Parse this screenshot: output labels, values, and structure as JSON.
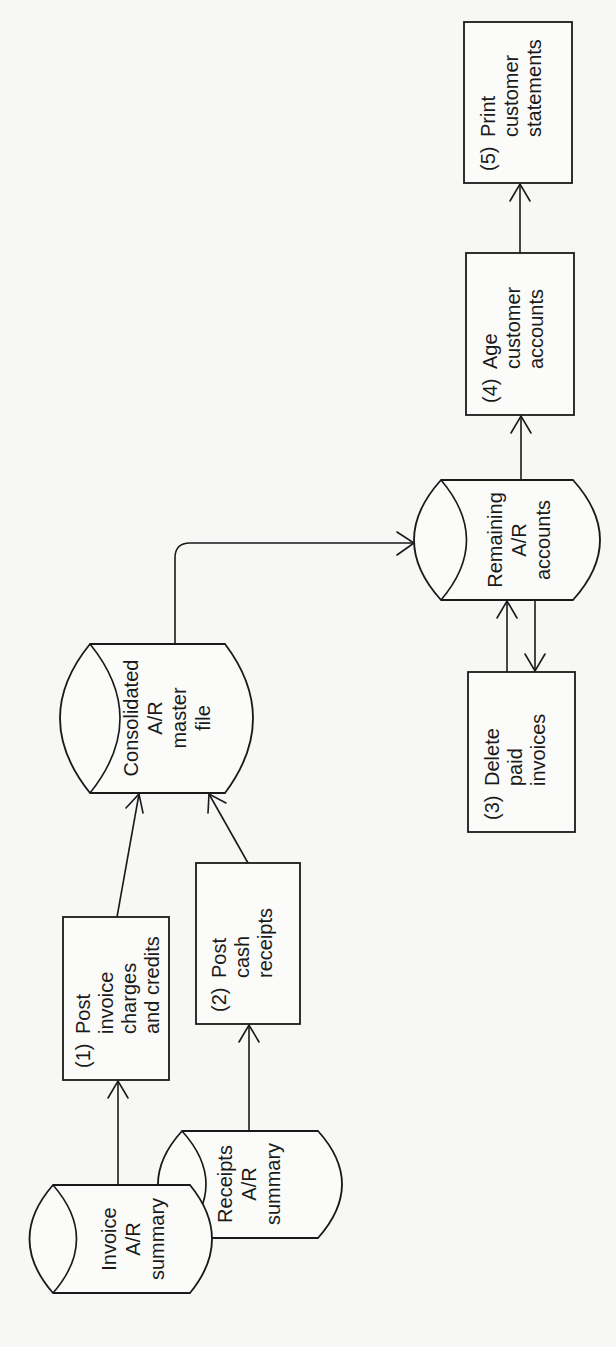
{
  "diagram": {
    "orientation": "rotated-90-ccw",
    "colors": {
      "ink": "#1a1a1a",
      "paper": "#f7f7f5"
    },
    "storage": {
      "invoice_summary": {
        "lines": [
          "Invoice",
          "A/R",
          "summary"
        ]
      },
      "receipts_summary": {
        "lines": [
          "Receipts",
          "A/R",
          "summary"
        ]
      },
      "consolidated_master": {
        "lines": [
          "Consolidated",
          "A/R",
          "master",
          "file"
        ]
      },
      "remaining_accounts": {
        "lines": [
          "Remaining",
          "A/R",
          "accounts"
        ]
      }
    },
    "processes": {
      "step1": {
        "number": "(1)",
        "lines": [
          "Post",
          "invoice",
          "charges",
          "and credits"
        ]
      },
      "step2": {
        "number": "(2)",
        "lines": [
          "Post",
          "cash",
          "receipts"
        ]
      },
      "step3": {
        "number": "(3)",
        "lines": [
          "Delete",
          "paid",
          "invoices"
        ]
      },
      "step4": {
        "number": "(4)",
        "lines": [
          "Age",
          "customer",
          "accounts"
        ]
      },
      "step5": {
        "number": "(5)",
        "lines": [
          "Print",
          "customer",
          "statements"
        ]
      }
    },
    "flows": [
      {
        "from": "Invoice A/R summary",
        "to": "(1) Post invoice charges and credits"
      },
      {
        "from": "Receipts A/R summary",
        "to": "(2) Post cash receipts"
      },
      {
        "from": "(1) Post invoice charges and credits",
        "to": "Consolidated A/R master file"
      },
      {
        "from": "(2) Post cash receipts",
        "to": "Consolidated A/R master file"
      },
      {
        "from": "Consolidated A/R master file",
        "to": "Remaining A/R accounts"
      },
      {
        "from": "Remaining A/R accounts",
        "to": "(3) Delete paid invoices"
      },
      {
        "from": "(3) Delete paid invoices",
        "to": "Remaining A/R accounts"
      },
      {
        "from": "Remaining A/R accounts",
        "to": "(4) Age customer accounts"
      },
      {
        "from": "(4) Age customer accounts",
        "to": "(5) Print customer statements"
      }
    ]
  }
}
